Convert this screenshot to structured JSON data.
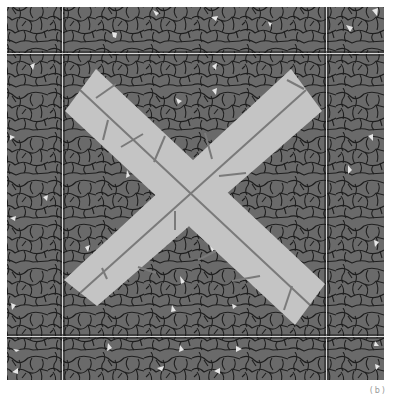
{
  "figure": {
    "caption": "(b)",
    "colors": {
      "field": "#6a6a6a",
      "crack_lines": "#1e1e1e",
      "slab": "#c4c4c4",
      "slab_joint": "#7a7a7a",
      "grid_line": "#d8d8d8",
      "chip": "#e6e6e6",
      "background": "#ffffff"
    },
    "layout": {
      "square": {
        "x": 7,
        "y": 7,
        "w": 377,
        "h": 373
      },
      "grid_x": [
        62,
        326
      ],
      "grid_y": [
        53,
        336
      ]
    }
  }
}
